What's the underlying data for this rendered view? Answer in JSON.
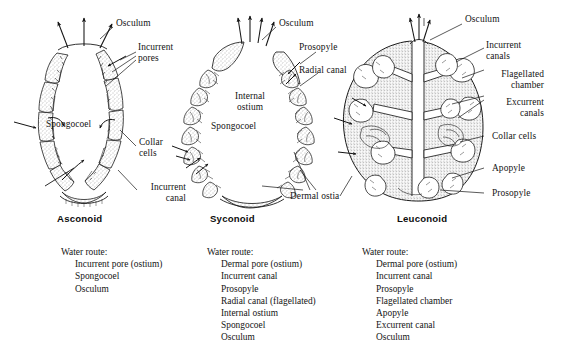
{
  "figure": {
    "ink_color": "#141414",
    "background_color": "#ffffff"
  },
  "panels": [
    {
      "id": "asconoid",
      "caption": "Asconoid",
      "labels": [
        {
          "name": "osculum",
          "text": "Osculum"
        },
        {
          "name": "incurrent-pores",
          "text": "Incurrent\npores"
        },
        {
          "name": "spongocoel",
          "text": "Spongocoel"
        },
        {
          "name": "collar-cells",
          "text": "Collar\ncells"
        },
        {
          "name": "incurrent-canal",
          "text": "Incurrent\ncanal"
        }
      ],
      "water_route": {
        "title": "Water route:",
        "steps": [
          "Incurrent pore (ostium)",
          "Spongocoel",
          "Osculum"
        ]
      }
    },
    {
      "id": "syconoid",
      "caption": "Syconoid",
      "labels": [
        {
          "name": "osculum",
          "text": "Osculum"
        },
        {
          "name": "prosopyle",
          "text": "Prosopyle"
        },
        {
          "name": "radial-canal",
          "text": "Radial canal"
        },
        {
          "name": "internal-ostium",
          "text": "Internal\nostium"
        },
        {
          "name": "spongocoel",
          "text": "Spongocoel"
        },
        {
          "name": "dermal-ostia",
          "text": "Dermal ostia"
        }
      ],
      "water_route": {
        "title": "Water route:",
        "steps": [
          "Dermal pore (ostium)",
          "Incurrent canal",
          "Prosopyle",
          "Radial canal (flagellated)",
          "Internal ostium",
          "Spongocoel",
          "Osculum"
        ]
      }
    },
    {
      "id": "leuconoid",
      "caption": "Leuconoid",
      "labels": [
        {
          "name": "osculum",
          "text": "Osculum"
        },
        {
          "name": "incurrent-canals",
          "text": "Incurrent\ncanals"
        },
        {
          "name": "flagellated-chamber",
          "text": "Flagellated\nchamber"
        },
        {
          "name": "excurrent-canals",
          "text": "Excurrent\ncanals"
        },
        {
          "name": "collar-cells",
          "text": "Collar cells"
        },
        {
          "name": "apopyle",
          "text": "Apopyle"
        },
        {
          "name": "prosopyle",
          "text": "Prosopyle"
        }
      ],
      "water_route": {
        "title": "Water route:",
        "steps": [
          "Dermal pore (ostium)",
          "Incurrent canal",
          "Prosopyle",
          "Flagellated chamber",
          "Apopyle",
          "Excurrent canal",
          "Osculum"
        ]
      }
    }
  ]
}
